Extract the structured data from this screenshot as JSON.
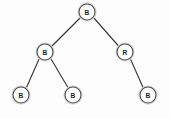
{
  "diagram": {
    "type": "binary-tree",
    "background_color": "#fdfdfd",
    "node_fill_color": "#ffffff",
    "node_stroke_color": "#4a4a4a",
    "edge_color": "#3a3a3a",
    "label_color": "#1d1d1d",
    "node_radius": 8,
    "nodes": [
      {
        "id": "root",
        "label": "B",
        "color_code": "black",
        "cx": 87,
        "cy": 12,
        "level": 0
      },
      {
        "id": "n-l",
        "label": "B",
        "color_code": "black",
        "cx": 45,
        "cy": 52,
        "level": 1
      },
      {
        "id": "n-r",
        "label": "R",
        "color_code": "red",
        "cx": 125,
        "cy": 52,
        "level": 1
      },
      {
        "id": "n-ll",
        "label": "B",
        "color_code": "black",
        "cx": 21,
        "cy": 95,
        "level": 2
      },
      {
        "id": "n-lr",
        "label": "B",
        "color_code": "black",
        "cx": 73,
        "cy": 95,
        "level": 2
      },
      {
        "id": "n-rr",
        "label": "B",
        "color_code": "black",
        "cx": 148,
        "cy": 95,
        "level": 2
      }
    ],
    "edges": [
      {
        "id": "e-root-l",
        "from": "root",
        "to": "n-l",
        "x1": 80.5,
        "y1": 17.5,
        "x2": 51.0,
        "y2": 47.0
      },
      {
        "id": "e-root-r",
        "from": "root",
        "to": "n-r",
        "x1": 93.5,
        "y1": 17.5,
        "x2": 119.0,
        "y2": 46.5
      },
      {
        "id": "e-l-ll",
        "from": "n-l",
        "to": "n-ll",
        "x1": 39.5,
        "y1": 58.0,
        "x2": 26.0,
        "y2": 88.5
      },
      {
        "id": "e-l-lr",
        "from": "n-l",
        "to": "n-lr",
        "x1": 50.5,
        "y1": 58.0,
        "x2": 68.5,
        "y2": 88.5
      },
      {
        "id": "e-r-rr",
        "from": "n-r",
        "to": "n-rr",
        "x1": 130.0,
        "y1": 58.0,
        "x2": 143.5,
        "y2": 88.5
      }
    ]
  }
}
